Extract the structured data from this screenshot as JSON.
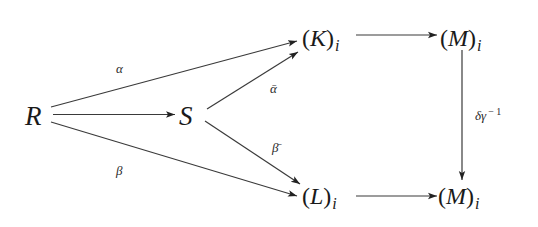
{
  "diagram": {
    "type": "commutative-diagram",
    "nodes": {
      "R": {
        "label": "R"
      },
      "S": {
        "label": "S"
      },
      "K": {
        "open": "(",
        "symbol": "K",
        "close": ")",
        "subscript": "i"
      },
      "M_top": {
        "open": "(",
        "symbol": "M",
        "close": ")",
        "subscript": "i"
      },
      "L": {
        "open": "(",
        "symbol": "L",
        "close": ")",
        "subscript": "i"
      },
      "M_bottom": {
        "open": "(",
        "symbol": "M",
        "close": ")",
        "subscript": "i"
      }
    },
    "edges": [
      {
        "from": "R",
        "to": "K",
        "label": "α"
      },
      {
        "from": "R",
        "to": "S",
        "label": ""
      },
      {
        "from": "R",
        "to": "L",
        "label": "β"
      },
      {
        "from": "S",
        "to": "K",
        "label": "ᾱ"
      },
      {
        "from": "S",
        "to": "L",
        "label": "β̄"
      },
      {
        "from": "K",
        "to": "M_top",
        "label": ""
      },
      {
        "from": "L",
        "to": "M_bottom",
        "label": ""
      },
      {
        "from": "M_top",
        "to": "M_bottom",
        "label": "δγ",
        "label_superscript": "− 1"
      }
    ],
    "labels": {
      "alpha": "α",
      "beta": "β",
      "alpha_bar": "ᾱ",
      "beta_bar": "β̄",
      "delta_gamma": "δγ",
      "inverse_exp": "− 1"
    }
  }
}
